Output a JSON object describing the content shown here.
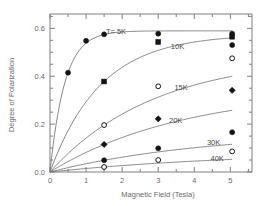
{
  "chart_data": {
    "type": "scatter",
    "title": "",
    "xlabel": "Magnetic Field   (Tesla)",
    "ylabel": "Degree of Polarization",
    "xlim": [
      0,
      5.6
    ],
    "ylim": [
      0,
      0.66
    ],
    "xticks": [
      0,
      1,
      2,
      3,
      4,
      5
    ],
    "xtick_labels": [
      "0",
      "1",
      "2",
      "3",
      "4",
      "5"
    ],
    "yticks": [
      0.0,
      0.2,
      0.4,
      0.6
    ],
    "ytick_labels": [
      "0.0",
      "0.2",
      "0.4",
      "0.6"
    ],
    "x_minor_step": 0.5,
    "y_minor_step": 0.05,
    "grid": false,
    "legend_position": "inline-annotations",
    "series": [
      {
        "name": "T= 5K",
        "label": "T= 5K",
        "marker": "filled-circle",
        "points": [
          {
            "x": 0.0,
            "y": 0.0
          },
          {
            "x": 0.5,
            "y": 0.415
          },
          {
            "x": 1.0,
            "y": 0.548
          },
          {
            "x": 1.5,
            "y": 0.575
          },
          {
            "x": 3.0,
            "y": 0.578
          },
          {
            "x": 5.05,
            "y": 0.578
          }
        ]
      },
      {
        "name": "10K",
        "label": "10K",
        "marker": "filled-square",
        "points": [
          {
            "x": 0.0,
            "y": 0.0
          },
          {
            "x": 1.5,
            "y": 0.378
          },
          {
            "x": 3.0,
            "y": 0.543
          },
          {
            "x": 5.05,
            "y": 0.565
          }
        ]
      },
      {
        "name": "10K-alt",
        "label": "",
        "marker": "filled-circle",
        "points": [
          {
            "x": 5.05,
            "y": 0.53
          }
        ]
      },
      {
        "name": "15K",
        "label": "15K",
        "marker": "open-circle",
        "points": [
          {
            "x": 0.0,
            "y": 0.0
          },
          {
            "x": 1.5,
            "y": 0.196
          },
          {
            "x": 3.0,
            "y": 0.358
          },
          {
            "x": 5.05,
            "y": 0.475
          }
        ]
      },
      {
        "name": "20K",
        "label": "20K",
        "marker": "filled-diamond",
        "points": [
          {
            "x": 0.0,
            "y": 0.0
          },
          {
            "x": 1.5,
            "y": 0.115
          },
          {
            "x": 3.0,
            "y": 0.222
          },
          {
            "x": 5.05,
            "y": 0.341
          }
        ]
      },
      {
        "name": "30K",
        "label": "30K",
        "marker": "filled-circle",
        "points": [
          {
            "x": 0.0,
            "y": 0.0
          },
          {
            "x": 1.5,
            "y": 0.049
          },
          {
            "x": 3.0,
            "y": 0.099
          },
          {
            "x": 5.05,
            "y": 0.166
          }
        ]
      },
      {
        "name": "40K",
        "label": "40K",
        "marker": "open-circle",
        "points": [
          {
            "x": 0.0,
            "y": 0.0
          },
          {
            "x": 1.5,
            "y": 0.021
          },
          {
            "x": 3.0,
            "y": 0.05
          },
          {
            "x": 5.05,
            "y": 0.086
          }
        ]
      }
    ],
    "annotations": [
      {
        "text": "T= 5K",
        "x": 1.55,
        "y": 0.585
      },
      {
        "text": "10K",
        "x": 3.35,
        "y": 0.525
      },
      {
        "text": "15K",
        "x": 3.45,
        "y": 0.355
      },
      {
        "text": "20K",
        "x": 3.3,
        "y": 0.215
      },
      {
        "text": "30K",
        "x": 4.35,
        "y": 0.125
      },
      {
        "text": "40K",
        "x": 4.45,
        "y": 0.058
      }
    ],
    "colors": {
      "axis": "#808080",
      "curve": "#7a7a7a",
      "marker_fill": "#141414",
      "marker_open_fill": "#ffffff",
      "text": "#6b6b6b",
      "background": "#ffffff"
    }
  }
}
